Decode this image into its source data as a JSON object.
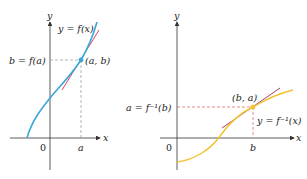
{
  "left_graph": {
    "axis_x_label": "x",
    "axis_y_label": "y",
    "origin_label": "0",
    "curve_label": "y = f(x)",
    "y_value_label": "b = f(a)",
    "point_label": "(a, b)",
    "x_tick_label": "a",
    "curve_color": "#3aa7d9",
    "tangent_color": "#d9475a"
  },
  "right_graph": {
    "axis_x_label": "x",
    "axis_y_label": "y",
    "origin_label": "0",
    "curve_label": "y = f⁻¹(x)",
    "y_value_label": "a = f⁻¹(b)",
    "point_label": "(b, a)",
    "x_tick_label": "b",
    "curve_color": "#f2c230",
    "tangent_color": "#a8405a"
  },
  "guide_color": "#e05a5a"
}
